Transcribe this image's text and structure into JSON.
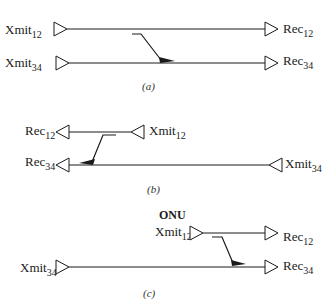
{
  "panels": [
    {
      "id": "a",
      "caption": "(a)",
      "xmit_top": {
        "base": "Xmit",
        "sub": "12"
      },
      "xmit_bottom": {
        "base": "Xmit",
        "sub": "34"
      },
      "rec_top": {
        "base": "Rec",
        "sub": "12"
      },
      "rec_bottom": {
        "base": "Rec",
        "sub": "34"
      }
    },
    {
      "id": "b",
      "caption": "(b)",
      "rec_top": {
        "base": "Rec",
        "sub": "12"
      },
      "xmit_top": {
        "base": "Xmit",
        "sub": "12"
      },
      "rec_bottom": {
        "base": "Rec",
        "sub": "34"
      },
      "xmit_bottom": {
        "base": "Xmit",
        "sub": "34"
      }
    },
    {
      "id": "c",
      "caption": "(c)",
      "onu_label": "ONU",
      "xmit_top": {
        "base": "Xmit",
        "sub": "12"
      },
      "rec_top": {
        "base": "Rec",
        "sub": "12"
      },
      "xmit_bottom": {
        "base": "Xmit",
        "sub": "34"
      },
      "rec_bottom": {
        "base": "Rec",
        "sub": "34"
      }
    }
  ],
  "colors": {
    "line": "#1a1a1a",
    "background": "#ffffff"
  }
}
